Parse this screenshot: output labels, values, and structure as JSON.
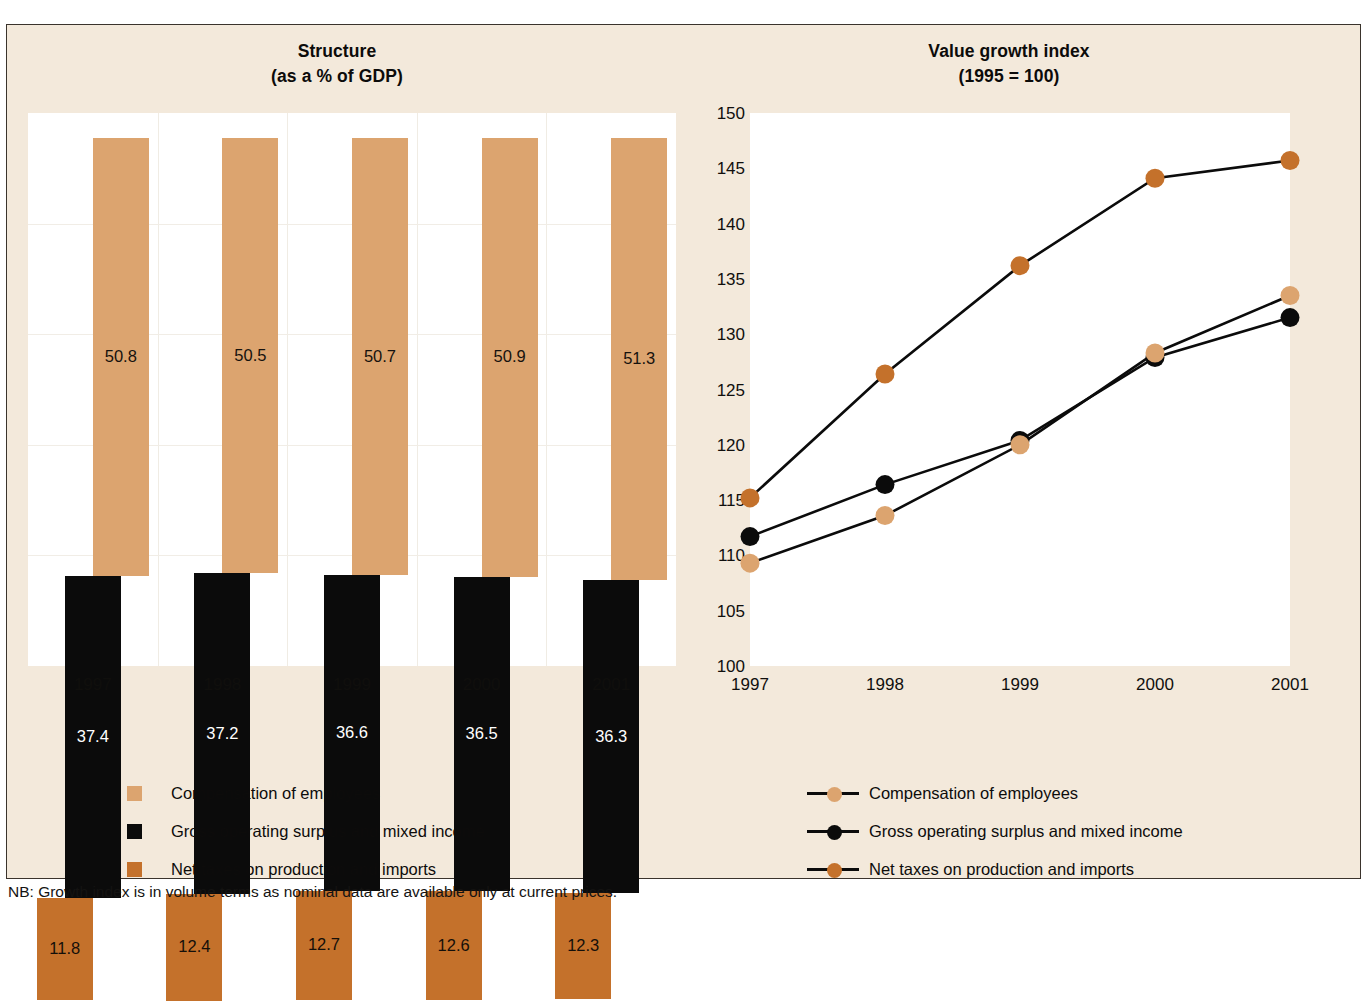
{
  "figure": {
    "background_color": "#f3e9db",
    "border_color": "#3a332c",
    "footnote": "NB: Growth index is in volume terms as nominal data are available only at current prices."
  },
  "colors": {
    "compensation": "#dca46f",
    "gross_operating_surplus": "#0b0b0b",
    "net_taxes": "#c4712b",
    "line": "#0b0b0b",
    "plot_background": "#ffffff"
  },
  "left_chart": {
    "title_line1": "Structure",
    "title_line2": "(as a % of GDP)"
  },
  "right_chart": {
    "title_line1": "Value growth index",
    "title_line2": "(1995 = 100)"
  },
  "legend": {
    "compensation": "Compensation of employees",
    "gross_operating_surplus": "Gross operating surplus and mixed income",
    "net_taxes": "Net taxes on production and imports"
  },
  "chart_data": [
    {
      "type": "bar",
      "title": "Structure (as a % of GDP)",
      "subtitle": "(as a % of GDP)",
      "xlabel": "",
      "ylabel": "% of GDP",
      "stacked": true,
      "staggered": true,
      "grid": true,
      "legend_position": "bottom",
      "categories": [
        "1997",
        "1998",
        "1999",
        "2000",
        "2001"
      ],
      "series": [
        {
          "name": "Compensation of employees",
          "color": "#dca46f",
          "values": [
            50.8,
            50.5,
            50.7,
            50.9,
            51.3
          ]
        },
        {
          "name": "Gross operating surplus and mixed income",
          "color": "#0b0b0b",
          "values": [
            37.4,
            37.2,
            36.6,
            36.5,
            36.3
          ]
        },
        {
          "name": "Net taxes on production and imports",
          "color": "#c4712b",
          "values": [
            11.8,
            12.4,
            12.7,
            12.6,
            12.3
          ]
        }
      ],
      "data_labels": [
        [
          "50.8",
          "50.5",
          "50.7",
          "50.9",
          "51.3"
        ],
        [
          "37.4",
          "37.2",
          "36.6",
          "36.5",
          "36.3"
        ],
        [
          "11.8",
          "12.4",
          "12.7",
          "12.6",
          "12.3"
        ]
      ]
    },
    {
      "type": "line",
      "title": "Value growth index (1995 = 100)",
      "subtitle": "(1995 = 100)",
      "xlabel": "",
      "ylabel": "Index (1995 = 100)",
      "grid": false,
      "legend_position": "bottom",
      "x": [
        "1997",
        "1998",
        "1999",
        "2000",
        "2001"
      ],
      "ylim": [
        100,
        150
      ],
      "ytick_labels": [
        "150",
        "145",
        "140",
        "135",
        "130",
        "125",
        "120",
        "115",
        "110",
        "105",
        "100"
      ],
      "yticks": [
        150,
        145,
        140,
        135,
        130,
        125,
        120,
        115,
        110,
        105,
        100
      ],
      "series": [
        {
          "name": "Net taxes on production and imports",
          "color": "#c4712b",
          "values": [
            115.2,
            126.4,
            136.2,
            144.1,
            145.7
          ]
        },
        {
          "name": "Gross operating surplus and mixed income",
          "color": "#0b0b0b",
          "values": [
            111.7,
            116.4,
            120.4,
            127.9,
            131.5
          ]
        },
        {
          "name": "Compensation of employees",
          "color": "#dca46f",
          "values": [
            109.3,
            113.6,
            120.0,
            128.3,
            133.5
          ]
        }
      ]
    }
  ]
}
